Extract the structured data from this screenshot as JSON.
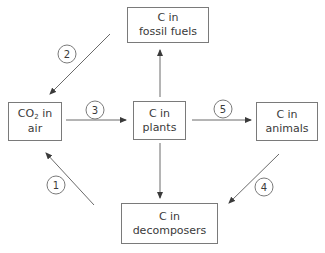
{
  "diagram": {
    "nodes": [
      {
        "id": "fossil",
        "line1": "C in",
        "line2": "fossil fuels"
      },
      {
        "id": "air",
        "line1_prefix": "CO",
        "line1_sub": "2",
        "line1_suffix": " in",
        "line2": "air"
      },
      {
        "id": "plants",
        "line1": "C in",
        "line2": "plants"
      },
      {
        "id": "animals",
        "line1": "C in",
        "line2": "animals"
      },
      {
        "id": "decomposers",
        "line1": "C in",
        "line2": "decomposers"
      }
    ],
    "edges": [
      {
        "from": "fossil",
        "to": "air",
        "label": "2"
      },
      {
        "from": "air",
        "to": "plants",
        "label": "3"
      },
      {
        "from": "plants",
        "to": "animals",
        "label": "5"
      },
      {
        "from": "plants",
        "to": "fossil",
        "label": ""
      },
      {
        "from": "plants",
        "to": "decomposers",
        "label": ""
      },
      {
        "from": "animals",
        "to": "decomposers",
        "label": "4"
      },
      {
        "from": "decomposers",
        "to": "air",
        "label": "1"
      }
    ],
    "labels": {
      "one": "1",
      "two": "2",
      "three": "3",
      "four": "4",
      "five": "5"
    }
  }
}
